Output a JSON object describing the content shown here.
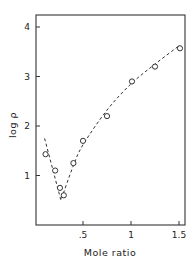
{
  "chart_data": {
    "type": "scatter",
    "title": "",
    "xlabel": "Mole ratio",
    "ylabel": "log ρ",
    "xlim": [
      0,
      1.55
    ],
    "ylim": [
      0,
      4.2
    ],
    "x_ticks": [
      {
        "value": 0.5,
        "label": ".5"
      },
      {
        "value": 1.0,
        "label": "1"
      },
      {
        "value": 1.5,
        "label": "1.5"
      }
    ],
    "y_ticks": [
      {
        "value": 1,
        "label": "1"
      },
      {
        "value": 2,
        "label": "2"
      },
      {
        "value": 3,
        "label": "3"
      },
      {
        "value": 4,
        "label": "4"
      }
    ],
    "grid": false,
    "legend": null,
    "series": [
      {
        "name": "measured",
        "marker": "open-circle",
        "x": [
          0.11,
          0.21,
          0.26,
          0.3,
          0.4,
          0.5,
          0.75,
          1.01,
          1.25,
          1.51
        ],
        "y": [
          1.43,
          1.1,
          0.75,
          0.6,
          1.25,
          1.7,
          2.2,
          2.9,
          3.2,
          3.57
        ]
      },
      {
        "name": "fit",
        "style": "dashed-line",
        "x": [
          0.1,
          0.27,
          0.4,
          0.5,
          0.75,
          1.0,
          1.25,
          1.5
        ],
        "y": [
          1.75,
          0.5,
          1.2,
          1.62,
          2.32,
          2.85,
          3.25,
          3.62
        ]
      }
    ]
  }
}
